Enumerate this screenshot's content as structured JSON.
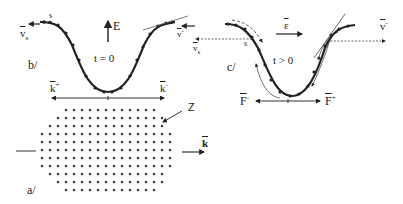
{
  "figure": {
    "panel_a": {
      "label": "a/",
      "fermi_surface_label": "Z",
      "wavevector_label": "k",
      "lattice_rows": [
        {
          "y": 110,
          "count": 12,
          "x_start": 66
        },
        {
          "y": 118,
          "count": 14,
          "x_start": 58
        },
        {
          "y": 126,
          "count": 15,
          "x_start": 50
        },
        {
          "y": 134,
          "count": 17,
          "x_start": 42
        },
        {
          "y": 142,
          "count": 17,
          "x_start": 42
        },
        {
          "y": 150,
          "count": 17,
          "x_start": 42
        },
        {
          "y": 158,
          "count": 17,
          "x_start": 42
        },
        {
          "y": 166,
          "count": 17,
          "x_start": 42
        },
        {
          "y": 174,
          "count": 15,
          "x_start": 50
        },
        {
          "y": 182,
          "count": 14,
          "x_start": 58
        },
        {
          "y": 190,
          "count": 12,
          "x_start": 66
        }
      ],
      "lattice_spacing": 8
    },
    "panel_b": {
      "label": "b/",
      "energy_axis_label": "E",
      "time_label": "t = 0",
      "left_velocity_label": "v",
      "left_velocity_sub": "s",
      "right_velocity_label": "v",
      "right_velocity_sup": "-",
      "point_label": "s",
      "k_plus_label": "k",
      "k_plus_sup": "+",
      "k_minus_label": "k",
      "k_minus_sup": "-"
    },
    "panel_c": {
      "label": "c/",
      "field_label": "ε",
      "time_label": "t > 0",
      "left_velocity_label": "v",
      "left_velocity_sub": "s",
      "right_velocity_label": "v",
      "right_velocity_sup": "-",
      "point_label": "s",
      "force_minus_label": "F",
      "force_minus_sup": "-",
      "force_plus_label": "F",
      "force_plus_sup": "+"
    },
    "colors": {
      "ink": "#222222",
      "dots": "#333333",
      "background": "#ffffff"
    }
  }
}
